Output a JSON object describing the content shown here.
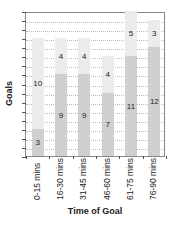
{
  "chart_data": {
    "type": "bar",
    "stacked": true,
    "title": "",
    "xlabel": "Time of Goal",
    "ylabel": "Goals",
    "categories": [
      "0-15 mins",
      "16-30 mins",
      "31-45 mins",
      "46-60 mins",
      "61-75 mins",
      "76-90 mins"
    ],
    "series": [
      {
        "name": "bottom",
        "color": "#cfcfcf",
        "values": [
          3,
          9,
          9,
          7,
          11,
          12
        ]
      },
      {
        "name": "top",
        "color": "#ececec",
        "values": [
          10,
          4,
          4,
          4,
          5,
          3
        ]
      }
    ],
    "ylim": [
      0,
      16
    ],
    "grid": true,
    "legend": false,
    "y_tick_labels_shown": false
  },
  "labels": {
    "ylabel": "Goals",
    "xlabel": "Time of Goal"
  }
}
